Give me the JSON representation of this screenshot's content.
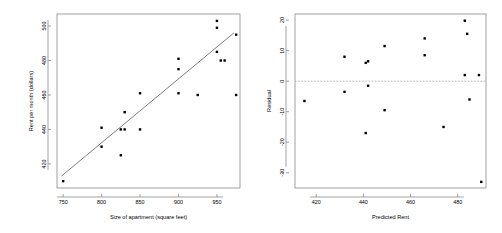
{
  "figure": {
    "background_color": "#ffffff",
    "point_color": "#000000",
    "line_color": "#6e6e6e",
    "axis_color": "#8a8a8a",
    "zero_line_color": "#9a9a9a"
  },
  "chart_data": [
    {
      "type": "scatter",
      "panel_name": "apartment-rent-scatter",
      "title": "",
      "xlabel": "Size of apartment (square feet)",
      "ylabel": "Rent per month (dollars)",
      "xlim": [
        742,
        980
      ],
      "ylim": [
        406,
        507
      ],
      "xticks": [
        750,
        800,
        850,
        900,
        950
      ],
      "xtick_labels": [
        "750",
        "800",
        "850",
        "900",
        "950"
      ],
      "yticks": [
        420,
        440,
        460,
        480,
        500
      ],
      "ytick_labels": [
        "420",
        "440",
        "460",
        "480",
        "500"
      ],
      "grid": false,
      "legend": "none",
      "x": [
        750,
        800,
        800,
        825,
        825,
        830,
        830,
        850,
        850,
        900,
        900,
        900,
        925,
        950,
        950,
        950,
        955,
        960,
        975,
        975
      ],
      "y": [
        410,
        430,
        441,
        425,
        440,
        440,
        450,
        440,
        461,
        461,
        475,
        481,
        460,
        485,
        499,
        503,
        480,
        480,
        460,
        495
      ],
      "fit_line": {
        "label": "least-squares regression line",
        "x_start": 748,
        "y_start": 413,
        "x_end": 972,
        "y_end": 496
      }
    },
    {
      "type": "scatter",
      "panel_name": "residual-plot",
      "title": "",
      "xlabel": "Predicted Rent",
      "ylabel": "Residual",
      "xlim": [
        411,
        492
      ],
      "ylim": [
        -35,
        22
      ],
      "xticks": [
        420,
        440,
        460,
        480
      ],
      "xtick_labels": [
        "420",
        "440",
        "460",
        "480"
      ],
      "yticks": [
        20,
        10,
        0,
        -10,
        -20,
        -30
      ],
      "ytick_labels": [
        "20",
        "10",
        "0",
        "-10",
        "-20",
        "-30"
      ],
      "grid": false,
      "legend": "none",
      "zero_reference_line": 0,
      "x": [
        415,
        432,
        432,
        441,
        441,
        442,
        442,
        449,
        449,
        466,
        466,
        474,
        483,
        483,
        484,
        485,
        489,
        490
      ],
      "y": [
        -6.5,
        8,
        -3.5,
        -17,
        6,
        6.5,
        -1.5,
        11.5,
        -9.5,
        14,
        8.5,
        -15,
        19.8,
        2,
        15.5,
        -6,
        2,
        -33
      ]
    }
  ]
}
